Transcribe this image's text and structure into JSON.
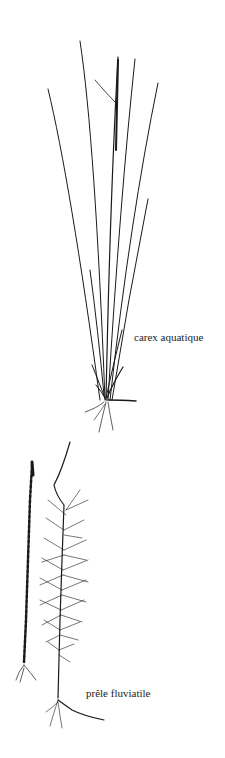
{
  "illustration": {
    "type": "botanical line drawing",
    "background": "#ffffff",
    "ink_color": "#1a1a1a",
    "plants": [
      {
        "name": "carex",
        "label": "carex aquatique"
      },
      {
        "name": "equisetum",
        "label": "prêle fluviatile"
      }
    ]
  }
}
